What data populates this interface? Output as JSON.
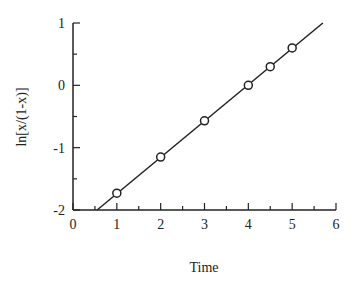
{
  "chart_data": {
    "type": "scatter",
    "title": "",
    "xlabel": "Time",
    "ylabel": "ln[x/(1-x)]",
    "xlim": [
      0,
      6
    ],
    "ylim": [
      -2,
      1
    ],
    "x_ticks": [
      0,
      1,
      2,
      3,
      4,
      5,
      6
    ],
    "y_ticks": [
      -2,
      -1,
      0,
      1
    ],
    "x_minor_tick_step": 0.5,
    "y_minor_tick_step": 0.5,
    "grid": false,
    "legend": null,
    "series": [
      {
        "name": "data",
        "marker": "open-circle",
        "x": [
          1,
          2,
          3,
          4,
          4.5,
          5
        ],
        "y": [
          -1.73,
          -1.15,
          -0.57,
          0.0,
          0.3,
          0.6
        ]
      },
      {
        "name": "fit",
        "type": "line",
        "x": [
          0.55,
          5.7
        ],
        "y": [
          -2.0,
          1.0
        ]
      }
    ]
  }
}
